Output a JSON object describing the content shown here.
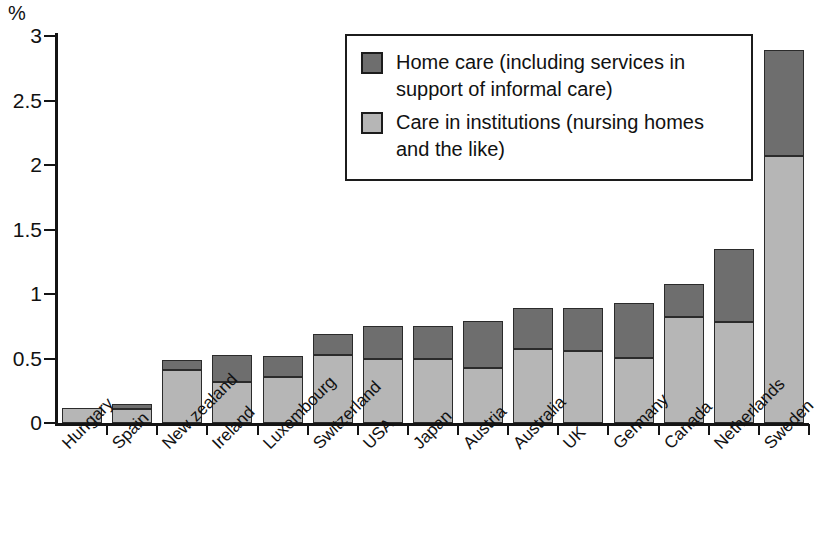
{
  "chart_data": {
    "type": "bar",
    "stacked": true,
    "title": "",
    "subtitle": "",
    "xlabel": "",
    "ylabel": "%",
    "unit_label": "%",
    "ylim": [
      0,
      3
    ],
    "ytick_labels": [
      "0",
      "0.5",
      "1",
      "1.5",
      "2",
      "2.5",
      "3"
    ],
    "ytick_values": [
      0,
      0.5,
      1,
      1.5,
      2,
      2.5,
      3
    ],
    "grid": false,
    "legend_position": "top-right-inset",
    "categories": [
      "Hungary",
      "Spain",
      "New zealand",
      "Ireland",
      "Luxembourg",
      "Switzerland",
      "USA",
      "Japan",
      "Austria",
      "Australia",
      "UK",
      "Germany",
      "Canada",
      "Netherlands",
      "Sweden"
    ],
    "series": [
      {
        "name": "Care in institutions (nursing homes and the like)",
        "key": "institutions",
        "color": "#b6b6b6",
        "values": [
          0.12,
          0.11,
          0.41,
          0.32,
          0.36,
          0.53,
          0.5,
          0.5,
          0.43,
          0.57,
          0.56,
          0.5,
          0.82,
          0.78,
          2.07
        ]
      },
      {
        "name": "Home care (including services in support of informal care)",
        "key": "home_care",
        "color": "#6e6e6e",
        "values": [
          0.0,
          0.04,
          0.08,
          0.21,
          0.16,
          0.16,
          0.25,
          0.25,
          0.36,
          0.32,
          0.33,
          0.43,
          0.26,
          0.57,
          0.82
        ]
      }
    ],
    "totals": [
      0.12,
      0.15,
      0.49,
      0.53,
      0.52,
      0.69,
      0.75,
      0.75,
      0.79,
      0.89,
      0.89,
      0.93,
      1.08,
      1.35,
      2.89
    ]
  },
  "legend": {
    "items": [
      {
        "label": "Home care (including services in support of informal care)",
        "swatch": "#6e6e6e"
      },
      {
        "label": "Care in institutions (nursing homes and the like)",
        "swatch": "#b6b6b6"
      }
    ]
  },
  "colors": {
    "home_care": "#6e6e6e",
    "institutions": "#b6b6b6",
    "axis": "#141414",
    "background": "#ffffff"
  }
}
